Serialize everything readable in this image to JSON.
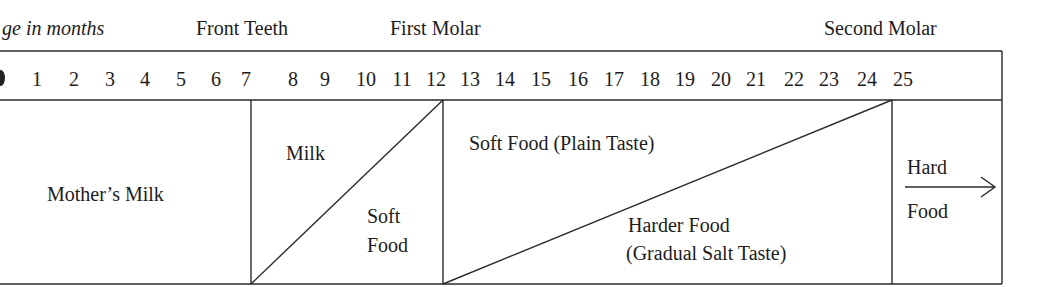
{
  "header": {
    "age_label": "Age in months",
    "age_label_visible": "ge in months",
    "milestones": [
      {
        "name": "Front Teeth",
        "month": 7
      },
      {
        "name": "First Molar",
        "month": 12
      },
      {
        "name": "Second Molar",
        "month": 24
      }
    ]
  },
  "months": [
    "1",
    "2",
    "3",
    "4",
    "5",
    "6",
    "7",
    "8",
    "9",
    "10",
    "11",
    "12",
    "13",
    "14",
    "15",
    "16",
    "17",
    "18",
    "19",
    "20",
    "21",
    "22",
    "23",
    "24",
    "25"
  ],
  "stages": [
    {
      "id": "mothers-milk",
      "range": [
        0,
        7
      ],
      "label": "Mother’s Milk"
    },
    {
      "id": "milk-to-soft",
      "range": [
        7,
        12
      ],
      "upper_label": "Milk",
      "lower_label_line1": "Soft",
      "lower_label_line2": "Food"
    },
    {
      "id": "soft-to-harder",
      "range": [
        12,
        24
      ],
      "upper_label": "Soft Food (Plain Taste)",
      "lower_label_line1": "Harder Food",
      "lower_label_line2": "(Gradual Salt Taste)"
    },
    {
      "id": "hard-food",
      "range": [
        24,
        25
      ],
      "label_line1": "Hard",
      "label_line2": "Food",
      "arrow": "right-arrow"
    }
  ],
  "colors": {
    "line": "#2a2a2a",
    "text": "#1c1c1c",
    "background": "#ffffff"
  }
}
